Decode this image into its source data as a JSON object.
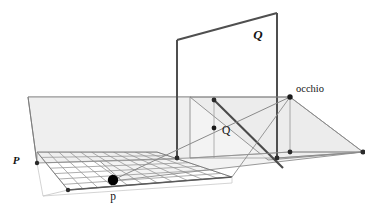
{
  "figure": {
    "name": "perspective-projection-diagram",
    "background_color": "#ffffff",
    "labels": {
      "object_plane": "Q",
      "image_plane": "P",
      "eye": "occhio",
      "projected_point": "Q",
      "image_point": "p"
    },
    "colors": {
      "stroke_dark": "#4d4d4d",
      "stroke_mid": "#777777",
      "stroke_light": "#9a9a9a",
      "grid": "#8e8e8e",
      "plane_fill": "#f1f1f1",
      "plane_fill_light": "#f6f6f6",
      "point_fill": "#000000",
      "text": "#141414"
    },
    "geometry": {
      "ground_plane_quad": "28,97 190,97 363,152 121,180",
      "backdrop_quad": "28,97 190,97 190,155 28,163",
      "right_plane_quad": "190,97 290,97 363,152 268,160",
      "object_plane_quad": "177,40 277,13 277,155 177,110",
      "grid_quad": "37,152 157,152 232,177 68,190",
      "grid_rows": 7,
      "grid_cols": 11,
      "vertical_post_left": "177,40 177,158",
      "vertical_post_right": "277,13 277,158",
      "sight_line_main": "214,100 283,163",
      "sight_line_to_eye_upper": "121,176 290,97",
      "sight_line_to_eye_lower": "232,160 290,97",
      "eye_point": "290,97",
      "projected_point": "214,128",
      "image_point": "113,180"
    },
    "points": [
      {
        "name": "image-point-p",
        "x": 113,
        "y": 180,
        "r": 5.2,
        "style": "filled-large"
      },
      {
        "name": "eye-point-occhio",
        "x": 290,
        "y": 97,
        "r": 2.6,
        "style": "filled-small"
      },
      {
        "name": "projected-point-Q",
        "x": 214,
        "y": 128,
        "r": 2.4,
        "style": "filled-small"
      },
      {
        "name": "vertex-ground-left",
        "x": 37,
        "y": 163,
        "r": 2.2,
        "style": "filled-small"
      },
      {
        "name": "vertex-ground-front",
        "x": 68,
        "y": 190,
        "r": 2.2,
        "style": "filled-small"
      },
      {
        "name": "vertex-base-post-left",
        "x": 177,
        "y": 158,
        "r": 2.4,
        "style": "filled-small"
      },
      {
        "name": "vertex-base-post-right",
        "x": 277,
        "y": 158,
        "r": 2.4,
        "style": "filled-small"
      },
      {
        "name": "vertex-right-plane-front",
        "x": 290,
        "y": 152,
        "r": 2.4,
        "style": "filled-small"
      },
      {
        "name": "vertex-right-plane-corner",
        "x": 363,
        "y": 152,
        "r": 2.6,
        "style": "filled-small"
      },
      {
        "name": "vertex-upper-ray-origin",
        "x": 214,
        "y": 100,
        "r": 2.4,
        "style": "filled-small"
      }
    ],
    "label_positions": {
      "object_plane": {
        "x": 258,
        "y": 38,
        "size": 12
      },
      "image_plane": {
        "x": 14,
        "y": 163,
        "size": 11
      },
      "eye": {
        "x": 295,
        "y": 92,
        "size": 10
      },
      "projected_point": {
        "x": 222,
        "y": 133,
        "size": 11
      },
      "image_point": {
        "x": 107,
        "y": 199,
        "size": 11
      }
    }
  }
}
